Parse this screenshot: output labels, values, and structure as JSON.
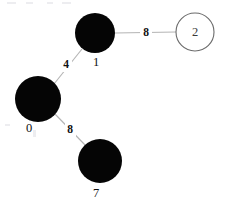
{
  "diagram": {
    "kind": "weighted-graph",
    "background_color": "#ffffff",
    "edge_color": "#b4b4b4",
    "filled_node_color": "#050505",
    "hollow_node_stroke": "#6b6b6b",
    "label_color": "#111111",
    "nodes": [
      {
        "id": "node-1",
        "label": "1",
        "cx": 95,
        "cy": 33,
        "r": 20,
        "style": "filled",
        "label_x": 96,
        "label_y": 63,
        "label_position": "below"
      },
      {
        "id": "node-2",
        "label": "2",
        "cx": 195,
        "cy": 32,
        "r": 19,
        "style": "hollow",
        "label_x": 195,
        "label_y": 32,
        "label_position": "inside"
      },
      {
        "id": "node-0",
        "label": "0",
        "cx": 38,
        "cy": 99,
        "r": 23,
        "style": "filled",
        "label_x": 29,
        "label_y": 129,
        "label_position": "below-left"
      },
      {
        "id": "node-7",
        "label": "7",
        "cx": 100,
        "cy": 161,
        "r": 22,
        "style": "filled",
        "label_x": 96,
        "label_y": 194,
        "label_position": "below"
      }
    ],
    "edges": [
      {
        "id": "edge-1-2",
        "source": "node-1",
        "target": "node-2",
        "weight": "8",
        "x1": 115,
        "y1": 33,
        "x2": 176,
        "y2": 32,
        "label_x": 146,
        "label_y": 33
      },
      {
        "id": "edge-0-1",
        "source": "node-0",
        "target": "node-1",
        "weight": "4",
        "x1": 54,
        "y1": 84,
        "x2": 82,
        "y2": 49,
        "label_x": 66,
        "label_y": 65
      },
      {
        "id": "edge-0-7",
        "source": "node-0",
        "target": "node-7",
        "weight": "8",
        "x1": 55,
        "y1": 114,
        "x2": 86,
        "y2": 146,
        "label_x": 70,
        "label_y": 130
      }
    ]
  }
}
